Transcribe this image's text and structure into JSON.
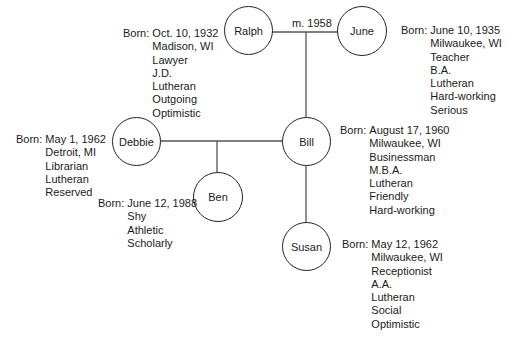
{
  "diagram": {
    "type": "genogram",
    "marriage_label": "m. 1958",
    "born_label": "Born:",
    "people": {
      "ralph": {
        "name": "Ralph",
        "details": [
          "Oct. 10, 1932",
          "Madison, WI",
          "Lawyer",
          "J.D.",
          "Lutheran",
          "Outgoing",
          "Optimistic"
        ]
      },
      "june": {
        "name": "June",
        "details": [
          "June 10, 1935",
          "Milwaukee, WI",
          "Teacher",
          "B.A.",
          "Lutheran",
          "Hard-working",
          "Serious"
        ]
      },
      "debbie": {
        "name": "Debbie",
        "details": [
          "May 1, 1962",
          "Detroit, MI",
          "Librarian",
          "Lutheran",
          "Reserved"
        ]
      },
      "bill": {
        "name": "Bill",
        "details": [
          "August 17, 1960",
          "Milwaukee, WI",
          "Businessman",
          "M.B.A.",
          "Lutheran",
          "Friendly",
          "Hard-working"
        ]
      },
      "ben": {
        "name": "Ben",
        "details": [
          "June 12, 1988",
          "Shy",
          "Athletic",
          "Scholarly"
        ]
      },
      "susan": {
        "name": "Susan",
        "details": [
          "May 12, 1962",
          "Milwaukee, WI",
          "Receptionist",
          "A.A.",
          "Lutheran",
          "Social",
          "Optimistic"
        ]
      }
    },
    "relations": [
      {
        "type": "marriage",
        "between": [
          "Ralph",
          "June"
        ],
        "label": "m. 1958"
      },
      {
        "type": "child",
        "parents": [
          "Ralph",
          "June"
        ],
        "children": [
          "Bill",
          "Susan"
        ]
      },
      {
        "type": "partnership",
        "between": [
          "Debbie",
          "Bill"
        ]
      },
      {
        "type": "child",
        "parents": [
          "Debbie",
          "Bill"
        ],
        "children": [
          "Ben"
        ]
      }
    ],
    "colors": {
      "line": "#555555",
      "circle": "#222222",
      "text": "#1a1a1a",
      "background": "#ffffff"
    }
  }
}
